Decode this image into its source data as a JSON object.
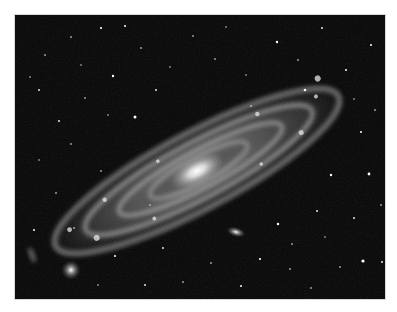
{
  "image": {
    "subject": "Andromeda galaxy (M31), grayscale infrared view",
    "alt": "Spiral galaxy seen at an oblique angle against a star field, with two small companion galaxies",
    "background_color": "#050505",
    "frame_color": "#ffffff",
    "features": [
      {
        "name": "galaxy-core",
        "x": 197,
        "y": 171
      },
      {
        "name": "companion-galaxy-elliptical",
        "x": 236,
        "y": 232
      },
      {
        "name": "companion-galaxy-lower-left",
        "x": 71,
        "y": 270
      }
    ]
  }
}
